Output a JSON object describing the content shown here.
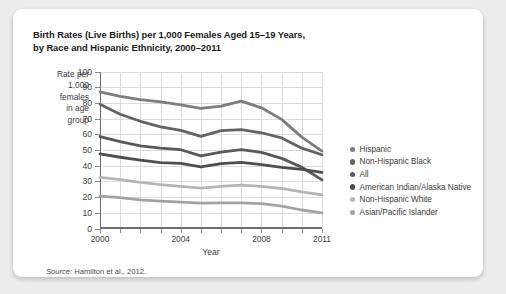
{
  "card": {
    "title_line1": "Birth Rates (Live Births) per 1,000 Females Aged 15–19 Years,",
    "title_line2": "by Race and Hispanic Ethnicity, 2000–2011",
    "source_prefix": "Source:",
    "source_text": "Hamilton et al., 2012."
  },
  "chart_data": {
    "type": "line",
    "title": "Birth Rates (Live Births) per 1,000 Females Aged 15–19 Years, by Race and Hispanic Ethnicity, 2000–2011",
    "xlabel": "Year",
    "ylabel": "Rate per 1,000 females in age group",
    "ylabel_lines": [
      "Rate per",
      "1,000",
      "females",
      "in age",
      "group"
    ],
    "x": [
      2000,
      2001,
      2002,
      2003,
      2004,
      2005,
      2006,
      2007,
      2008,
      2009,
      2010,
      2011
    ],
    "xlim": [
      2000,
      2011
    ],
    "ylim": [
      0,
      100
    ],
    "yticks": [
      0,
      10,
      20,
      30,
      40,
      50,
      60,
      70,
      80,
      90,
      100
    ],
    "xticks": [
      2000,
      2001,
      2002,
      2003,
      2004,
      2005,
      2006,
      2007,
      2008,
      2009,
      2010,
      2011
    ],
    "xtick_labels_shown": [
      2000,
      2004,
      2008,
      2011
    ],
    "grid": true,
    "legend_position": "right",
    "series": [
      {
        "name": "Hispanic",
        "color": "#7d7d7d",
        "values": [
          87.3,
          84.4,
          82.4,
          81.0,
          79.1,
          76.8,
          78.2,
          81.4,
          77.2,
          69.8,
          58.5,
          49.6
        ]
      },
      {
        "name": "Non-Hispanic Black",
        "color": "#636363",
        "values": [
          79.4,
          73.1,
          68.6,
          65.0,
          62.8,
          59.0,
          62.6,
          63.3,
          61.3,
          58.0,
          51.5,
          47.3
        ]
      },
      {
        "name": "All",
        "color": "#595959",
        "values": [
          58.9,
          55.6,
          52.9,
          51.5,
          50.5,
          46.6,
          49.0,
          50.5,
          48.8,
          45.0,
          39.3,
          31.3
        ]
      },
      {
        "name": "American Indian/Alaska Native",
        "color": "#4e4e4e",
        "values": [
          47.8,
          45.7,
          43.8,
          42.3,
          41.8,
          39.5,
          41.6,
          42.4,
          41.0,
          39.2,
          38.0,
          36.1
        ]
      },
      {
        "name": "Non-Hispanic White",
        "color": "#b5b5b5",
        "values": [
          32.9,
          31.5,
          29.7,
          28.3,
          27.2,
          26.1,
          27.2,
          28.0,
          27.2,
          25.8,
          23.7,
          21.7
        ]
      },
      {
        "name": "Asian/Pacific Islander",
        "color": "#a3a3a3",
        "values": [
          21.0,
          20.0,
          18.6,
          17.7,
          17.1,
          16.5,
          16.6,
          16.7,
          16.1,
          14.6,
          12.1,
          10.2
        ]
      }
    ]
  }
}
